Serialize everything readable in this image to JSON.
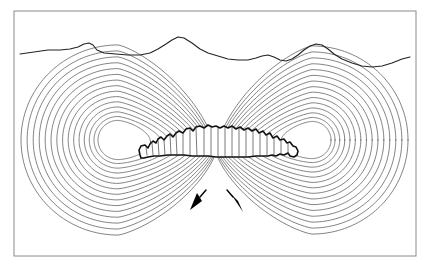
{
  "figure": {
    "canvas": {
      "width": 432,
      "height": 271
    },
    "background_color": "#ffffff"
  },
  "frame": {
    "name": "figure-border",
    "x": 14,
    "y": 11,
    "width": 402,
    "height": 245,
    "stroke_color": "#8a8a8a",
    "stroke_width": 1
  },
  "terrain": {
    "label": "ground surface profile",
    "stroke_color": "#222222",
    "stroke_width": 1.1,
    "points": "20,54 34,52 48,50 60,50 70,49 78,47 84,44 89,43 93,45 97,50 104,53 116,54 128,55 140,55 150,53 158,49 166,44 172,40 178,37 184,38 192,43 200,49 208,53 218,56 228,59 238,60 248,60 256,58 262,56 268,55 274,57 280,60 286,61 292,59 298,55 304,50 310,46 316,44 322,45 328,49 334,54 342,59 352,63 362,66 372,67 382,66 392,63 402,59 410,57"
  },
  "contours": {
    "label": "nested equipotential contour loops",
    "stroke_color": "#4d4d4d",
    "stroke_width": 0.7,
    "count_per_lobe": 15,
    "convergence_point": {
      "x": 216,
      "y": 152
    },
    "left_lobe": {
      "name": "left-contour-lobe",
      "center": {
        "x": 118,
        "y": 140
      },
      "inner_radius": 20,
      "outer_radius": 97
    },
    "right_lobe": {
      "name": "right-contour-lobe",
      "center": {
        "x": 312,
        "y": 140
      },
      "inner_radius": 19,
      "outer_radius": 96
    }
  },
  "blob": {
    "label": "fractured near-surface mass",
    "fill_color": "#ffffff",
    "stroke_color": "#111111",
    "stroke_width": 1.6,
    "hatch_color": "#333333",
    "hatch_width": 0.65,
    "left_tip": {
      "x": 140,
      "y": 155
    },
    "right_tip": {
      "x": 296,
      "y": 156
    },
    "crest": {
      "x": 216,
      "y": 127
    },
    "outline": "140,155 139,150 141,146 145,145 148,148 150,144 153,141 156,143 158,139 161,137 164,140 167,136 170,134 173,137 176,133 179,131 183,133 186,129 190,128 193,131 196,127 200,126 204,128 208,125 212,127 216,126 220,128 224,126 228,128 232,126 236,129 240,127 244,130 248,128 252,131 256,129 259,133 263,131 266,135 270,133 273,138 277,136 280,140 284,139 287,143 290,142 293,146 296,147 298,151 297,155 294,157 290,156 288,153 284,155 280,154 276,156 272,155 268,156 262,156 256,156 248,157 240,157 232,157 224,157 216,157 208,156 200,156 192,156 184,155 176,155 168,155 160,156 154,156 148,157 144,158 141,158",
    "hatch_lines": [
      "146,147 147,155",
      "152,143 153,155",
      "158,140 159,155",
      "164,140 165,155",
      "170,135 171,155",
      "176,134 177,155",
      "183,133 183,155",
      "190,129 190,155",
      "196,128 197,156",
      "204,128 204,156",
      "211,126 211,156",
      "218,127 218,157",
      "225,127 225,157",
      "232,127 232,157",
      "239,128 239,157",
      "246,129 246,157",
      "253,130 253,156",
      "260,133 260,156",
      "267,135 267,156",
      "274,138 274,156",
      "281,140 281,155",
      "288,144 288,154"
    ]
  },
  "arrows": {
    "label": "displacement direction indicators",
    "fill_color": "#000000",
    "stroke_color": "#000000",
    "left": {
      "name": "left-down-arrow",
      "stem": "206,190 200,197",
      "head": "190,210 197,193 202,201"
    },
    "right": {
      "name": "right-down-arrow",
      "stem": "227,190 233,197",
      "head": "243,212 231,194 238,201"
    }
  }
}
